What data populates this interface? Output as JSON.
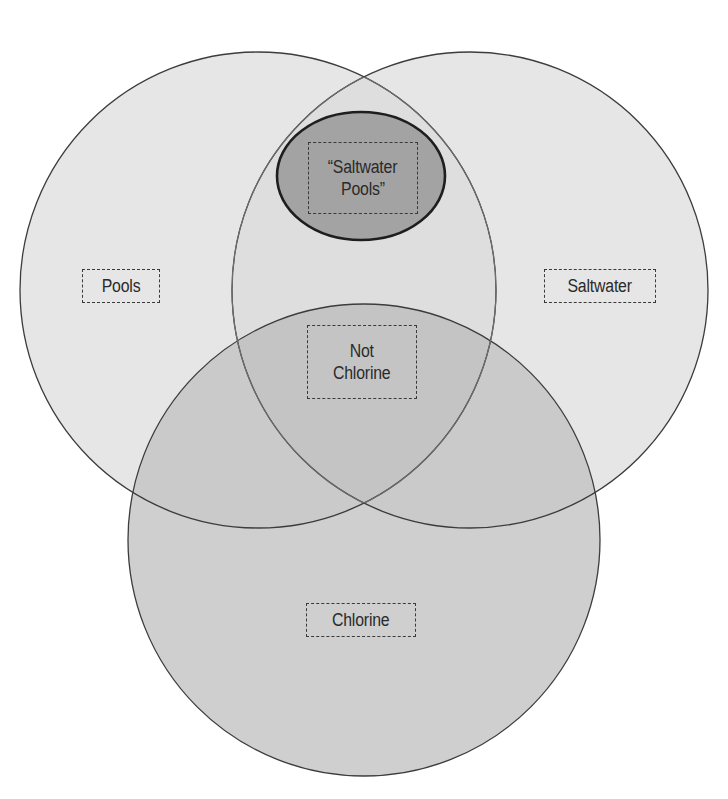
{
  "diagram": {
    "type": "venn",
    "colors": {
      "background": "#ffffff",
      "outer_fill": "#e6e6e6",
      "pair_overlap_fill": "#d4d4d4",
      "bottom_fill": "#cfcfcf",
      "center_overlap_fill": "#c4c4c4",
      "highlight_fill": "#a3a3a3",
      "stroke": "#3c3c3c",
      "inner_stroke": "#6e6e6e"
    },
    "sets": [
      {
        "id": "pools",
        "label": "Pools"
      },
      {
        "id": "saltwater",
        "label": "Saltwater"
      },
      {
        "id": "chlorine",
        "label": "Chlorine"
      }
    ],
    "regions": {
      "pools_label": "Pools",
      "saltwater_label": "Saltwater",
      "chlorine_label": "Chlorine",
      "center_label_line1": "Not",
      "center_label_line2": "Chlorine",
      "highlight_label_line1": "“Saltwater",
      "highlight_label_line2": "Pools”"
    }
  }
}
